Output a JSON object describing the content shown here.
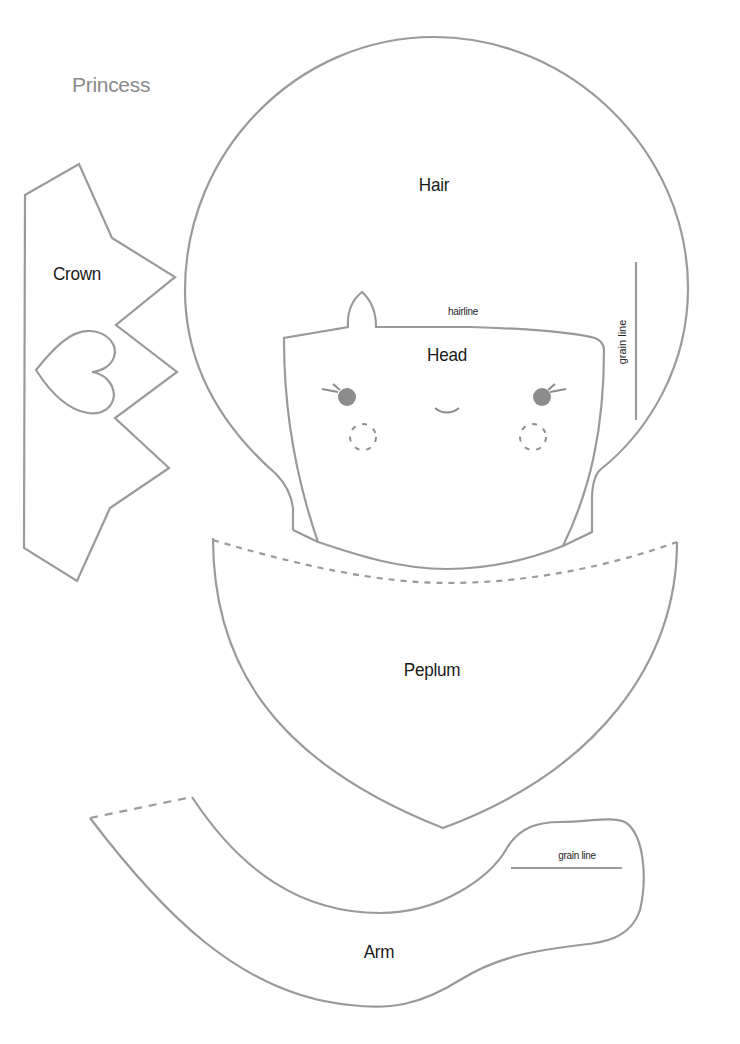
{
  "title": "Princess",
  "pieces": {
    "crown": {
      "label": "Crown"
    },
    "hair": {
      "label": "Hair",
      "grain_label": "grain line"
    },
    "head": {
      "label": "Head",
      "hairline_label": "hairline"
    },
    "peplum": {
      "label": "Peplum"
    },
    "arm": {
      "label": "Arm",
      "grain_label": "grain line"
    }
  },
  "colors": {
    "outline": "#9a9a9a",
    "feature": "#8c8c8c",
    "text": "#1a1a1a",
    "title": "#8a8a8a"
  }
}
